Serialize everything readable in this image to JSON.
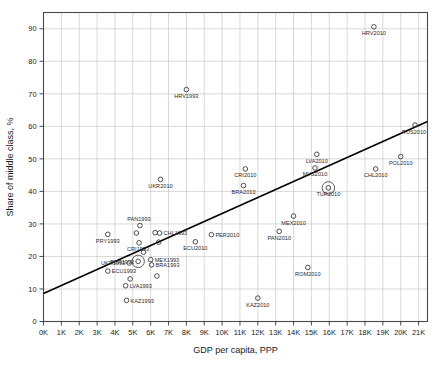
{
  "chart_data": {
    "type": "scatter",
    "title": "",
    "xlabel": "GDP per capita, PPP",
    "ylabel": "Share of middle class, %",
    "xlim": [
      0,
      21500
    ],
    "ylim": [
      0,
      95
    ],
    "grid": true,
    "legend": "none",
    "x_tick_labels": [
      "0K",
      "1K",
      "2K",
      "3K",
      "4K",
      "5K",
      "6K",
      "7K",
      "8K",
      "9K",
      "10K",
      "11K",
      "12K",
      "13K",
      "14K",
      "15K",
      "16K",
      "17K",
      "18K",
      "19K",
      "20K",
      "21K"
    ],
    "x_tick_values": [
      0,
      1000,
      2000,
      3000,
      4000,
      5000,
      6000,
      7000,
      8000,
      9000,
      10000,
      11000,
      12000,
      13000,
      14000,
      15000,
      16000,
      17000,
      18000,
      19000,
      20000,
      21000
    ],
    "y_tick_labels": [
      "0",
      "10",
      "20",
      "30",
      "40",
      "50",
      "60",
      "70",
      "80",
      "90"
    ],
    "y_tick_values": [
      0,
      10,
      20,
      30,
      40,
      50,
      60,
      70,
      80,
      90
    ],
    "marker": "open-circle",
    "marker_color": "#3c3c3c",
    "trendline": {
      "label": "fitted regression line",
      "color": "#000000",
      "x_start": 0,
      "y_start": 8.6,
      "x_end": 21500,
      "y_end": 61.5
    },
    "highlighted_points": [
      "TUR1993",
      "TUR2010"
    ],
    "points": [
      {
        "label": "HRV2010",
        "x": 18500,
        "y": 90.6,
        "label_pos": "below"
      },
      {
        "label": "RUS2010",
        "x": 20800,
        "y": 60.4,
        "label_pos": "below-left"
      },
      {
        "label": "POL2010",
        "x": 20000,
        "y": 50.7,
        "label_pos": "below"
      },
      {
        "label": "CHL2010",
        "x": 18600,
        "y": 46.9,
        "label_pos": "below"
      },
      {
        "label": "LVA2010",
        "x": 15300,
        "y": 51.4,
        "label_pos": "below"
      },
      {
        "label": "MYS2010",
        "x": 15200,
        "y": 47.2,
        "label_pos": "below"
      },
      {
        "label": "TUR2010",
        "x": 15950,
        "y": 41.1,
        "label_pos": "below",
        "highlight": true
      },
      {
        "label": "CRI2010",
        "x": 11300,
        "y": 46.9,
        "label_pos": "below"
      },
      {
        "label": "BRA2010",
        "x": 11200,
        "y": 41.8,
        "label_pos": "below"
      },
      {
        "label": "UKR2010",
        "x": 6550,
        "y": 43.7,
        "label_pos": "below"
      },
      {
        "label": "HRV1993",
        "x": 8000,
        "y": 71.3,
        "label_pos": "below"
      },
      {
        "label": "MEX2010",
        "x": 14000,
        "y": 32.4,
        "label_pos": "below"
      },
      {
        "label": "PAN2010",
        "x": 13200,
        "y": 27.7,
        "label_pos": "below"
      },
      {
        "label": "PER2010",
        "x": 9400,
        "y": 26.7,
        "label_pos": "right"
      },
      {
        "label": "ECU2010",
        "x": 8500,
        "y": 24.5,
        "label_pos": "below"
      },
      {
        "label": "ROM2010",
        "x": 14800,
        "y": 16.6,
        "label_pos": "below"
      },
      {
        "label": "KAZ2010",
        "x": 12000,
        "y": 7.2,
        "label_pos": "below"
      },
      {
        "label": "PAN1993",
        "x": 5400,
        "y": 29.5,
        "label_pos": "above-left"
      },
      {
        "label": "PRY1993",
        "x": 3600,
        "y": 26.8,
        "label_pos": "below"
      },
      {
        "label": "CHL1993",
        "x": 6500,
        "y": 27.2,
        "label_pos": "right"
      },
      {
        "label": "CRI1993",
        "x": 5350,
        "y": 24.2,
        "label_pos": "below-left"
      },
      {
        "label": "TUR1993",
        "x": 5300,
        "y": 18.5,
        "label_pos": "left",
        "highlight": true
      },
      {
        "label": "MEX1993",
        "x": 6000,
        "y": 19.0,
        "label_pos": "right"
      },
      {
        "label": "BRA1993",
        "x": 6050,
        "y": 17.4,
        "label_pos": "right"
      },
      {
        "label": "UKR1993",
        "x": 4800,
        "y": 18.0,
        "label_pos": "left"
      },
      {
        "label": "ECU1993",
        "x": 3600,
        "y": 15.5,
        "label_pos": "right"
      },
      {
        "label": "LVA1993",
        "x": 4600,
        "y": 11.0,
        "label_pos": "right"
      },
      {
        "label": "KAZ1993",
        "x": 4650,
        "y": 6.5,
        "label_pos": "right"
      },
      {
        "label": "",
        "x": 5200,
        "y": 27.2,
        "label_pos": "none"
      },
      {
        "label": "",
        "x": 6250,
        "y": 27.3,
        "label_pos": "none"
      },
      {
        "label": "",
        "x": 6450,
        "y": 24.4,
        "label_pos": "none"
      },
      {
        "label": "",
        "x": 6350,
        "y": 14.0,
        "label_pos": "none"
      },
      {
        "label": "",
        "x": 4850,
        "y": 13.1,
        "label_pos": "none"
      },
      {
        "label": "",
        "x": 5600,
        "y": 21.3,
        "label_pos": "none"
      }
    ]
  }
}
